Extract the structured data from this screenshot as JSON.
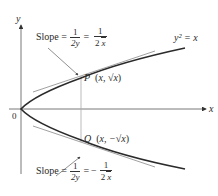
{
  "diagram": {
    "curve_label": "y² = x",
    "axis_x_label": "x",
    "axis_y_label": "y",
    "origin_label": "0",
    "point_p": {
      "name": "P",
      "coords": "(x, √x)",
      "coords_x": "x,",
      "coords_y": "√x"
    },
    "point_q": {
      "name": "Q",
      "coords": "(x, −√x)",
      "coords_x": "x,",
      "coords_y": "−√x"
    },
    "slope_upper": {
      "prefix": "Slope =",
      "frac1_num": "1",
      "frac1_den": "2y",
      "equals": "=",
      "frac2_num": "1",
      "frac2_den_pre": "2",
      "frac2_den_rad": "x",
      "sign": ""
    },
    "slope_lower": {
      "prefix": "Slope =",
      "frac1_num": "1",
      "frac1_den": "2y",
      "equals": "=",
      "frac2_num": "1",
      "frac2_den_pre": "2",
      "frac2_den_rad": "x",
      "sign": "−"
    },
    "colors": {
      "curve": "#2b2b2b",
      "axis": "#555555",
      "tangent": "#777777",
      "guide": "#aaaaaa",
      "text": "#2a2a2a"
    }
  }
}
